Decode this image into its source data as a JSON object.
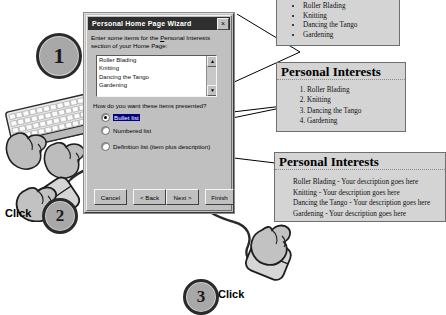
{
  "dialog": {
    "title": "Personal Home Page Wizard",
    "close_icon": "close-icon",
    "close_glyph": "×",
    "prompt_pre": "Enter some items for the ",
    "prompt_underlined": "P",
    "prompt_mid": "ersonal Interests section of",
    "prompt_line2": "your Home Page:",
    "list_items": [
      "Roller Blading",
      "Knitting",
      "Dancing the Tango",
      "Gardening"
    ],
    "scroll_up_glyph": "▲",
    "scroll_down_glyph": "▼",
    "radio_prompt": "How do you want these items presented?",
    "radios": [
      {
        "label": "Bullet list",
        "selected": true
      },
      {
        "label": "Numbered list",
        "selected": false
      },
      {
        "label": "Definition list (item plus description)",
        "selected": false
      }
    ],
    "buttons": {
      "cancel": "Cancel",
      "back": "< Back",
      "next": "Next >",
      "finish": "Finish"
    }
  },
  "previews": {
    "bullet": {
      "items": [
        "Roller Blading",
        "Knitting",
        "Dancing the Tango",
        "Gardening"
      ]
    },
    "numbered": {
      "heading": "Personal Interests",
      "items": [
        "Roller Blading",
        "Knitting",
        "Dancing the Tango",
        "Gardening"
      ]
    },
    "definition": {
      "heading": "Personal Interests",
      "lines": [
        "Roller Blading -  Your description goes here",
        "Knitting - Your description goes here",
        "Dancing the Tango - Your description goes here",
        "Gardening - Your description goes here"
      ]
    }
  },
  "steps": {
    "one": "1",
    "two": "2",
    "three": "3",
    "click_label": "Click"
  },
  "colors": {
    "dialog_face": "#c0c0c0",
    "titlebar": "#2f2f2f",
    "panel_face": "#d4d4d4",
    "circle_fill": "#a8a8a8",
    "circle_ring": "#2a2a2a"
  }
}
